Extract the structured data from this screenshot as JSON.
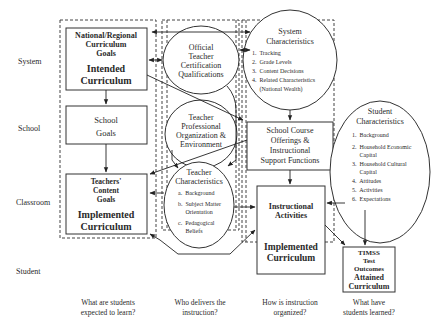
{
  "levels": [
    "System",
    "School",
    "Classroom",
    "Student"
  ],
  "columns": {
    "questions": [
      [
        "What are students",
        "expected to learn?"
      ],
      [
        "Who delivers the",
        "instruction?"
      ],
      [
        "How is instruction",
        "organized?"
      ],
      [
        "What have",
        "students learned?"
      ]
    ]
  },
  "nodes": {
    "national_goals": {
      "title": [
        "National/Regional",
        "Curriculum",
        "Goals"
      ],
      "subtitle": [
        "Intended",
        "Curriculum"
      ]
    },
    "school_goals": {
      "title": [
        "School",
        "Goals"
      ]
    },
    "teacher_content_goals": {
      "title": [
        "Teachers'",
        "Content",
        "Goals"
      ],
      "subtitle": [
        "Implemented",
        "Curriculum"
      ]
    },
    "official_certification": {
      "title": [
        "Official",
        "Teacher",
        "Certification",
        "Qualifications"
      ]
    },
    "teacher_professional": {
      "title": [
        "Teacher",
        "Professional",
        "Organization &",
        "Environment"
      ]
    },
    "teacher_characteristics": {
      "title": [
        "Teacher",
        "Characteristics"
      ],
      "items": [
        "a.  Background",
        "b.  Subject Matter",
        "     Orientation",
        "c.  Pedagogical",
        "     Beliefs"
      ]
    },
    "system_characteristics": {
      "title": [
        "System",
        "Characteristics"
      ],
      "items": [
        "1.  Tracking",
        "2.  Grade Levels",
        "3.  Content Decisions",
        "4.  Related Characteristics",
        "     (National Wealth)"
      ]
    },
    "school_course_offerings": {
      "title": [
        "School Course",
        "Offerings &",
        "Instructional",
        "Support Functions"
      ]
    },
    "instructional_activities": {
      "title": [
        "Instructional",
        "Activities"
      ],
      "subtitle": [
        "Implemented",
        "Curriculum"
      ]
    },
    "student_characteristics": {
      "title": [
        "Student",
        "Characteristics"
      ],
      "items": [
        "1.  Background",
        "2.  Household Economic",
        "     Capital",
        "3.  Household Cultural",
        "     Capital",
        "4.  Attitudes",
        "5.  Activities",
        "6.  Expectations"
      ]
    },
    "timss_outcomes": {
      "title": [
        "TIMSS",
        "Test",
        "Outcomes"
      ],
      "subtitle": [
        "Attained",
        "Curriculum"
      ]
    }
  }
}
